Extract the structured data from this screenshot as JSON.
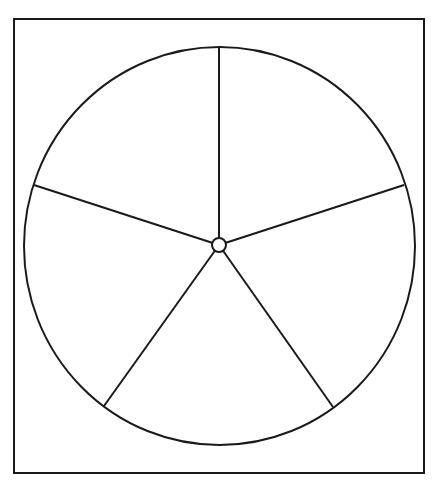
{
  "diagram": {
    "type": "divided-circle",
    "sections": 5,
    "colors": {
      "background": "#ffffff",
      "stroke": "#1a1a1a"
    },
    "frame": {
      "x": 14,
      "y": 19,
      "width": 410,
      "height": 454,
      "stroke_width": 2
    },
    "circle": {
      "cx": 219.5,
      "cy": 246,
      "rx": 195.5,
      "ry": 199,
      "stroke_width": 2
    },
    "hub": {
      "cx": 219,
      "cy": 245,
      "r": 7,
      "stroke_width": 2
    },
    "spokes": [
      {
        "name": "spoke-top",
        "x2": 219,
        "y2": 47
      },
      {
        "name": "spoke-upper-right",
        "x2": 404,
        "y2": 185
      },
      {
        "name": "spoke-lower-right",
        "x2": 333,
        "y2": 407
      },
      {
        "name": "spoke-lower-left",
        "x2": 104,
        "y2": 406
      },
      {
        "name": "spoke-upper-left",
        "x2": 34,
        "y2": 185
      }
    ]
  }
}
